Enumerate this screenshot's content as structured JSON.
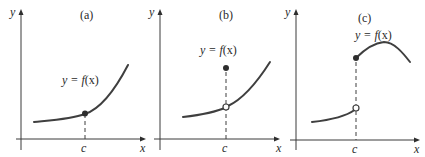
{
  "figure": {
    "panels": [
      {
        "id": "a",
        "title": "(a)",
        "y_axis_label": "y",
        "x_axis_label": "x",
        "c_label": "c",
        "function_label_prefix": "y = ",
        "function_label_f": "f",
        "function_label_args": "(x)",
        "point_at_c": "filled (continuous)"
      },
      {
        "id": "b",
        "title": "(b)",
        "y_axis_label": "y",
        "x_axis_label": "x",
        "c_label": "c",
        "function_label_prefix": "y = ",
        "function_label_f": "f",
        "function_label_args": "(x)",
        "point_at_c": "open circle on curve, filled dot above (removable discontinuity)"
      },
      {
        "id": "c",
        "title": "(c)",
        "y_axis_label": "y",
        "x_axis_label": "x",
        "c_label": "c",
        "function_label_prefix": "y = ",
        "function_label_f": "f",
        "function_label_args": "(x)",
        "point_at_c": "open circle at end of left branch, filled dot at start of right branch (jump discontinuity)"
      }
    ],
    "colors": {
      "stroke": "#3f3f3f",
      "background": "#ffffff"
    }
  }
}
